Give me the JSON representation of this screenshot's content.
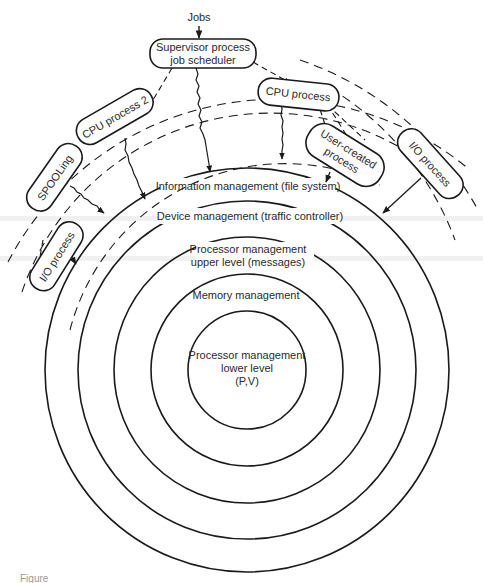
{
  "diagram": {
    "input_label": "Jobs",
    "supervisor": {
      "line1": "Supervisor process",
      "line2": "job scheduler"
    },
    "processes": {
      "cpu_process": "CPU process",
      "cpu_process_2": "CPU process 2",
      "spooling": "SPOOLing",
      "io_process_left": "I/O process",
      "user_created_line1": "User-created",
      "user_created_line2": "process",
      "io_process_right": "I/O process"
    },
    "rings": [
      {
        "label": "Information management (file system)"
      },
      {
        "label": "Device management (traffic controller)"
      },
      {
        "label_line1": "Processor management",
        "label_line2": "upper level (messages)"
      },
      {
        "label": "Memory management"
      },
      {
        "label_line1": "Processor management",
        "label_line2": "lower level",
        "label_line3": "(P,V)"
      }
    ],
    "caption": "Figure"
  },
  "colors": {
    "ink": "#1a1a1a",
    "text": "#2a2a2a",
    "background": "#ffffff"
  }
}
